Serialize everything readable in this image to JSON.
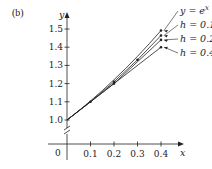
{
  "chart_data": {
    "type": "line",
    "panel_label": "(b)",
    "title": "",
    "xlabel": "x",
    "ylabel": "y",
    "origin_label": "0",
    "xlim": [
      0,
      0.45
    ],
    "ylim": [
      1.0,
      1.55
    ],
    "x_ticks": [
      0.1,
      0.2,
      0.3,
      0.4
    ],
    "x_tick_labels": [
      "0.1",
      "0.2",
      "0.3",
      "0.4"
    ],
    "y_ticks": [
      1.0,
      1.1,
      1.2,
      1.3,
      1.4,
      1.5
    ],
    "y_tick_labels": [
      "1.0",
      "1.1",
      "1.2",
      "1.3",
      "1.4",
      "1.5"
    ],
    "y_axis_break": true,
    "grid": false,
    "legend_placement": "right",
    "series": [
      {
        "name": "y = e^x",
        "label_main": "y = e",
        "label_sup": "x",
        "x": [
          0,
          0.05,
          0.1,
          0.15,
          0.2,
          0.25,
          0.3,
          0.35,
          0.4
        ],
        "y": [
          1.0,
          1.0513,
          1.1052,
          1.1618,
          1.2214,
          1.284,
          1.3499,
          1.4191,
          1.4918
        ],
        "marker_at_end_only": true
      },
      {
        "name": "h = 0.1",
        "label_main": "h = 0.1",
        "label_sup": "",
        "x": [
          0,
          0.1,
          0.2,
          0.3,
          0.4
        ],
        "y": [
          1.0,
          1.1,
          1.21,
          1.331,
          1.4641
        ]
      },
      {
        "name": "h = 0.2",
        "label_main": "h = 0.2",
        "label_sup": "",
        "x": [
          0,
          0.2,
          0.4
        ],
        "y": [
          1.0,
          1.2,
          1.44
        ]
      },
      {
        "name": "h = 0.4",
        "label_main": "h = 0.4",
        "label_sup": "",
        "x": [
          0,
          0.4
        ],
        "y": [
          1.0,
          1.4
        ]
      }
    ],
    "colors": {
      "ink": "#222222"
    }
  }
}
